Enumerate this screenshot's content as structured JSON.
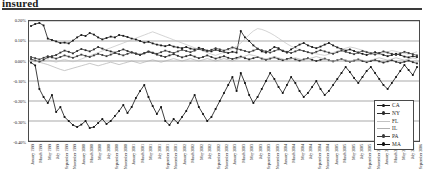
{
  "runhead": {
    "text": "insured"
  },
  "chart_data": {
    "type": "line",
    "title": "",
    "subtitle": "",
    "xlabel": "",
    "ylabel": "",
    "ylim": [
      -0.004,
      0.002
    ],
    "yticks": [
      0.002,
      0.001,
      0.0,
      -0.001,
      -0.002,
      -0.003,
      -0.004
    ],
    "ytick_labels": [
      "0.20%",
      "0.10%",
      "0.00%",
      "-0.10%",
      "-0.20%",
      "-0.30%",
      "-0.40%"
    ],
    "grid": true,
    "legend_position": "right-inside",
    "legend": [
      "CA",
      "NY",
      "FL",
      "IL",
      "PA",
      "MA"
    ],
    "colors": {
      "CA": "#161616",
      "NY": "#2b2b2b",
      "FL": "#c2c2c2",
      "IL": "#b0b0b0",
      "PA": "#3a3a3a",
      "MA": "#0d0d0d"
    },
    "x": [
      "January 1999",
      "February 1999",
      "March 1999",
      "April 1999",
      "May 1999",
      "June 1999",
      "July 1999",
      "August 1999",
      "September 1999",
      "October 1999",
      "November 1999",
      "December 1999",
      "January 2000",
      "February 2000",
      "March 2000",
      "April 2000",
      "May 2000",
      "June 2000",
      "July 2000",
      "August 2000",
      "September 2000",
      "October 2000",
      "November 2000",
      "December 2000",
      "January 2001",
      "February 2001",
      "March 2001",
      "April 2001",
      "May 2001",
      "June 2001",
      "July 2001",
      "August 2001",
      "September 2001",
      "October 2001",
      "November 2001",
      "December 2001",
      "January 2002",
      "February 2002",
      "March 2002",
      "April 2002",
      "May 2002",
      "June 2002",
      "July 2002",
      "August 2002",
      "September 2002",
      "October 2002",
      "November 2002",
      "December 2002",
      "January 2003",
      "February 2003",
      "March 2003",
      "April 2003",
      "May 2003",
      "June 2003",
      "July 2003",
      "August 2003",
      "September 2003",
      "October 2003",
      "November 2003",
      "December 2003",
      "January 2004",
      "February 2004",
      "March 2004",
      "April 2004",
      "May 2004",
      "June 2004",
      "July 2004",
      "August 2004",
      "September 2004",
      "October 2004",
      "November 2004",
      "December 2004",
      "January 2005",
      "February 2005",
      "March 2005",
      "April 2005",
      "May 2005",
      "June 2005",
      "July 2005",
      "August 2005",
      "September 2005",
      "October 2005",
      "November 2005",
      "December 2005",
      "January 2006",
      "February 2006",
      "March 2006",
      "April 2006",
      "May 2006",
      "June 2006",
      "July 2006",
      "August 2006",
      "September 2006"
    ],
    "xtick_labels": [
      "January 1999",
      "March 1999",
      "May 1999",
      "July 1999",
      "September 1999",
      "November 1999",
      "January 2000",
      "March 2000",
      "May 2000",
      "July 2000",
      "September 2000",
      "November 2000",
      "January 2001",
      "March 2001",
      "May 2001",
      "July 2001",
      "September 2001",
      "November 2001",
      "January 2002",
      "March 2002",
      "May 2002",
      "July 2002",
      "September 2002",
      "November 2002",
      "January 2003",
      "March 2003",
      "May 2003",
      "July 2003",
      "September 2003",
      "November 2003",
      "January 2004",
      "March 2004",
      "May 2004",
      "July 2004",
      "September 2004",
      "November 2004",
      "January 2005",
      "March 2005",
      "May 2005",
      "July 2005",
      "September 2005",
      "November 2005",
      "January 2006",
      "March 2006",
      "May 2006",
      "July 2006",
      "September 2006"
    ],
    "series": [
      {
        "name": "CA",
        "marker": true,
        "values": [
          0.00175,
          0.00185,
          0.0019,
          0.00178,
          0.00112,
          0.00105,
          0.00098,
          0.0009,
          0.00092,
          0.00088,
          0.00102,
          0.00118,
          0.0013,
          0.00125,
          0.0014,
          0.00132,
          0.00118,
          0.00108,
          0.00115,
          0.00122,
          0.00118,
          0.0013,
          0.00126,
          0.0012,
          0.00112,
          0.00108,
          0.001,
          0.00092,
          0.00096,
          0.00088,
          0.00082,
          0.00078,
          0.00074,
          0.0008,
          0.00072,
          0.00068,
          0.00064,
          0.0007,
          0.00062,
          0.00058,
          0.00066,
          0.0006,
          0.00052,
          0.00048,
          0.00056,
          0.0005,
          0.00044,
          0.0004,
          0.00046,
          0.00042,
          0.0015,
          0.00118,
          0.001,
          0.00078,
          0.00062,
          0.00048,
          0.00042,
          0.00055,
          0.0007,
          0.00064,
          0.0005,
          0.00042,
          0.00058,
          0.0007,
          0.00082,
          0.0009,
          0.00078,
          0.0007,
          0.00064,
          0.00072,
          0.00082,
          0.0009,
          0.00078,
          0.00068,
          0.0006,
          0.00052,
          0.00058,
          0.0005,
          0.00042,
          0.00036,
          0.0003,
          0.00038,
          0.00044,
          0.00038,
          0.0003,
          0.00024,
          0.0003,
          0.00036,
          0.0003,
          0.00022,
          0.00018,
          0.00024,
          0.0002
        ]
      },
      {
        "name": "NY",
        "marker": true,
        "values": [
          0.0001,
          2e-05,
          -4e-05,
          6e-05,
          0.00018,
          0.00024,
          0.0003,
          0.00042,
          0.00052,
          0.00046,
          0.00038,
          0.0005,
          0.0006,
          0.00054,
          0.00048,
          0.00058,
          0.0007,
          0.00062,
          0.00054,
          0.00048,
          0.00042,
          0.0005,
          0.00058,
          0.0005,
          0.00042,
          0.00036,
          0.0003,
          0.00038,
          0.00046,
          0.0004,
          0.00032,
          0.00026,
          0.0002,
          0.00028,
          0.00034,
          0.00026,
          0.00018,
          0.00024,
          0.0003,
          0.00022,
          0.00014,
          0.0002,
          0.00028,
          0.0002,
          0.00012,
          0.00018,
          0.00024,
          0.00016,
          0.0001,
          0.00016,
          0.00022,
          0.00014,
          8e-05,
          0.00014,
          0.0002,
          0.00012,
          6e-05,
          0.00012,
          0.00018,
          0.0001,
          4e-05,
          0.0001,
          0.00016,
          8e-05,
          2e-05,
          8e-05,
          0.00014,
          6e-05,
          0.0,
          6e-05,
          0.00012,
          4e-05,
          -2e-05,
          4e-05,
          0.0001,
          2e-05,
          -4e-05,
          2e-05,
          8e-05,
          0.0,
          -6e-05,
          0.0,
          6e-05,
          -2e-05,
          -8e-05,
          -2e-05,
          4e-05,
          -4e-05,
          -0.0001,
          -4e-05,
          2e-05,
          -6e-05,
          -0.00012
        ]
      },
      {
        "name": "FL",
        "marker": false,
        "values": [
          2e-05,
          -4e-05,
          4e-05,
          -2e-05,
          6e-05,
          0.0,
          -6e-05,
          2e-05,
          8e-05,
          2e-05,
          -4e-05,
          2e-05,
          0.0001,
          0.00018,
          0.00026,
          0.00034,
          0.00042,
          0.0005,
          0.00058,
          0.00066,
          0.00074,
          0.00082,
          0.0009,
          0.00098,
          0.00106,
          0.00114,
          0.00122,
          0.0013,
          0.00138,
          0.00146,
          0.00138,
          0.0013,
          0.00122,
          0.00114,
          0.00106,
          0.00098,
          0.0009,
          0.00082,
          0.00074,
          0.00066,
          0.00058,
          0.0005,
          0.00042,
          0.00034,
          0.00028,
          0.00036,
          0.00044,
          0.00052,
          0.00062,
          0.00074,
          0.0009,
          0.0011,
          0.00132,
          0.0015,
          0.00162,
          0.00158,
          0.0015,
          0.0014,
          0.00128,
          0.00114,
          0.001,
          0.00086,
          0.00074,
          0.00064,
          0.00056,
          0.0005,
          0.00044,
          0.0004,
          0.00036,
          0.00032,
          0.00028,
          0.00034,
          0.00042,
          0.0005,
          0.00058,
          0.00064,
          0.0007,
          0.00066,
          0.0006,
          0.00054,
          0.00048,
          0.00042,
          0.00038,
          0.00034,
          0.0004,
          0.00046,
          0.00052,
          0.00048,
          0.00042,
          0.00038,
          0.00034,
          0.0004,
          0.00046
        ]
      },
      {
        "name": "IL",
        "marker": false,
        "values": [
          4e-05,
          0.0,
          -6e-05,
          -0.00012,
          -0.00018,
          -0.00026,
          -0.00034,
          -0.00042,
          -0.00048,
          -0.00042,
          -0.00036,
          -0.0003,
          -0.00024,
          -0.00018,
          -0.00012,
          -0.00018,
          -0.00024,
          -0.00018,
          -0.00012,
          -6e-05,
          -0.00012,
          -0.00018,
          -0.00012,
          -6e-05,
          0.0,
          -6e-05,
          -0.00012,
          -6e-05,
          0.0,
          6e-05,
          0.0,
          -6e-05,
          0.0,
          6e-05,
          0.00012,
          6e-05,
          0.0,
          6e-05,
          0.00012,
          6e-05,
          0.0,
          6e-05,
          0.00012,
          6e-05,
          0.0,
          6e-05,
          0.00012,
          6e-05,
          0.0,
          8e-05,
          0.00016,
          0.00024,
          0.00032,
          0.00028,
          0.00022,
          0.00016,
          0.0001,
          0.00016,
          0.00022,
          0.00016,
          0.0001,
          4e-05,
          0.0001,
          0.00016,
          0.0001,
          4e-05,
          0.0001,
          0.00016,
          0.00022,
          0.00016,
          0.0001,
          4e-05,
          -2e-05,
          4e-05,
          0.0001,
          4e-05,
          -2e-05,
          4e-05,
          0.0001,
          4e-05,
          -2e-05,
          4e-05,
          0.0001,
          0.00016,
          0.0001,
          4e-05,
          0.0001,
          0.00016,
          0.0001,
          4e-05,
          0.0001,
          0.00016,
          0.0001
        ]
      },
      {
        "name": "PA",
        "marker": true,
        "values": [
          0.0002,
          0.00014,
          8e-05,
          0.00016,
          0.00024,
          0.00018,
          0.00012,
          0.0002,
          0.00028,
          0.00022,
          0.00016,
          0.00024,
          0.00032,
          0.00026,
          0.0002,
          0.00028,
          0.00036,
          0.0003,
          0.00024,
          0.00032,
          0.0004,
          0.00034,
          0.00028,
          0.00036,
          0.00044,
          0.00038,
          0.00032,
          0.0004,
          0.00048,
          0.00042,
          0.00036,
          0.00044,
          0.00052,
          0.00046,
          0.0004,
          0.00048,
          0.00056,
          0.0005,
          0.00044,
          0.00052,
          0.0006,
          0.00054,
          0.00048,
          0.00056,
          0.00064,
          0.00058,
          0.00052,
          0.0006,
          0.00068,
          0.00062,
          0.00056,
          0.0005,
          0.00044,
          0.00052,
          0.0006,
          0.00054,
          0.00048,
          0.00042,
          0.0005,
          0.00058,
          0.00052,
          0.00046,
          0.0004,
          0.00048,
          0.00056,
          0.0005,
          0.00044,
          0.00038,
          0.00046,
          0.00054,
          0.00048,
          0.00042,
          0.00036,
          0.00044,
          0.00052,
          0.00046,
          0.0004,
          0.00034,
          0.00042,
          0.0005,
          0.00044,
          0.00038,
          0.00032,
          0.0004,
          0.00048,
          0.00042,
          0.00036,
          0.0003,
          0.00038,
          0.00046,
          0.0004,
          0.00034,
          0.00028
        ]
      },
      {
        "name": "MA",
        "marker": true,
        "values": [
          -8e-05,
          -0.00022,
          -0.0014,
          -0.0018,
          -0.0021,
          -0.0017,
          -0.00255,
          -0.0023,
          -0.0028,
          -0.003,
          -0.0032,
          -0.0033,
          -0.00318,
          -0.003,
          -0.00335,
          -0.0033,
          -0.0031,
          -0.0029,
          -0.00315,
          -0.003,
          -0.00275,
          -0.0025,
          -0.0022,
          -0.0026,
          -0.0023,
          -0.00185,
          -0.0015,
          -0.0012,
          -0.0018,
          -0.00225,
          -0.00265,
          -0.0023,
          -0.003,
          -0.0032,
          -0.0029,
          -0.0031,
          -0.0028,
          -0.0025,
          -0.0021,
          -0.0017,
          -0.0023,
          -0.00265,
          -0.003,
          -0.0028,
          -0.0024,
          -0.002,
          -0.0016,
          -0.0012,
          -0.0008,
          -0.0015,
          -0.0006,
          -0.0011,
          -0.0017,
          -0.0021,
          -0.0018,
          -0.0014,
          -0.001,
          -0.0006,
          -0.0009,
          -0.0013,
          -0.0016,
          -0.0012,
          -0.0008,
          -0.0011,
          -0.0015,
          -0.0018,
          -0.0016,
          -0.0013,
          -0.001,
          -0.0014,
          -0.0017,
          -0.0015,
          -0.0012,
          -0.0009,
          -0.0006,
          -0.0003,
          -0.00055,
          -0.00085,
          -0.0011,
          -0.0008,
          -0.0005,
          -0.0003,
          -0.0006,
          -0.0009,
          -0.0012,
          -0.0014,
          -0.0011,
          -0.0008,
          -0.0005,
          -0.0002,
          -0.00045,
          -0.0007,
          -0.0003
        ]
      }
    ]
  }
}
